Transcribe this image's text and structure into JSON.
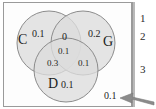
{
  "figure": {
    "type": "venn-diagram-3-set",
    "frame_border_color": "#9a9a9a",
    "circle_fill_color": "#dcdcdc",
    "circle_stroke_color": "#8c8c8c",
    "text_color": "#1d1d1d"
  },
  "sets": [
    {
      "key": "C",
      "label": "C",
      "position": "left"
    },
    {
      "key": "G",
      "label": "G",
      "position": "right"
    },
    {
      "key": "D",
      "label": "D",
      "position": "bottom"
    }
  ],
  "regions": [
    {
      "key": "C_only",
      "label": "C only",
      "value": "0.1"
    },
    {
      "key": "G_only",
      "label": "G only",
      "value": "0.2"
    },
    {
      "key": "D_only",
      "label": "D only",
      "value": "0.1"
    },
    {
      "key": "C_and_G",
      "label": "C and G only",
      "value": "0"
    },
    {
      "key": "C_and_D",
      "label": "C and D only",
      "value": "0.3"
    },
    {
      "key": "G_and_D",
      "label": "G and D only",
      "value": "0.1"
    },
    {
      "key": "C_G_D",
      "label": "C and G and D",
      "value": "0.1"
    },
    {
      "key": "outside",
      "label": "outside all sets",
      "value": "0.1"
    }
  ],
  "annotations": {
    "arrow": {
      "name": "arrow-to-outside-value",
      "points_to": "outside",
      "direction": "right-to-left"
    }
  },
  "margin_ticks": [
    {
      "label": "1"
    },
    {
      "label": "2"
    },
    {
      "label": "3"
    }
  ]
}
